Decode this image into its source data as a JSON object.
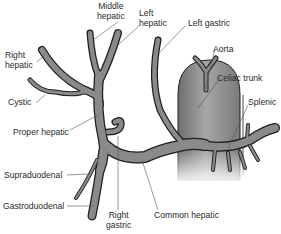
{
  "diagram": {
    "colors": {
      "vessel_fill": "#8a8a8a",
      "vessel_outline": "#1e1e1e",
      "aorta_fill": "#9c9c9c",
      "leader_line": "#555555",
      "text": "#2a2a2a",
      "background": "#ffffff"
    },
    "labels": {
      "middle_hepatic": [
        "Middle",
        "hepatic"
      ],
      "left_hepatic": [
        "Left",
        "hepatic"
      ],
      "left_gastric": "Left gastric",
      "right_hepatic": [
        "Right",
        "hepatic"
      ],
      "aorta": "Aorta",
      "celiac_trunk": "Celiac trunk",
      "cystic": "Cystic",
      "splenic": "Splenic",
      "proper_hepatic": "Proper hepatic",
      "supraduodenal": "Supraduodenal",
      "gastroduodenal": "Gastroduodenal",
      "right_gastric": [
        "Right",
        "gastric"
      ],
      "common_hepatic": "Common hepatic"
    }
  }
}
